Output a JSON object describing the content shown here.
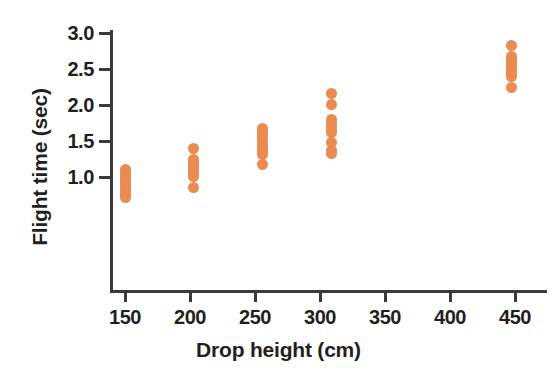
{
  "chart_data": {
    "type": "scatter",
    "title": "",
    "xlabel": "Drop height (cm)",
    "ylabel": "Flight time (sec)",
    "xlim": [
      125,
      475
    ],
    "ylim": [
      0.6,
      3.05
    ],
    "grid": false,
    "legend": null,
    "point_color": "#ea8b52",
    "axis_color": "#3a3a3a",
    "text_color": "#231f20",
    "xticks": [
      150,
      200,
      250,
      300,
      350,
      400,
      450
    ],
    "xtick_labels": [
      "150",
      "200",
      "250",
      "300",
      "350",
      "400",
      "450"
    ],
    "yticks": [
      1.0,
      1.5,
      2.0,
      2.5,
      3.0
    ],
    "ytick_labels": [
      "1.0",
      "1.5",
      "2.0",
      "2.5",
      "3.0"
    ],
    "series": [
      {
        "name": "Flight time measurements",
        "points": [
          {
            "x": 150,
            "y": 1.1
          },
          {
            "x": 150,
            "y": 1.07
          },
          {
            "x": 150,
            "y": 1.04
          },
          {
            "x": 150,
            "y": 1.01
          },
          {
            "x": 150,
            "y": 0.98
          },
          {
            "x": 150,
            "y": 0.95
          },
          {
            "x": 150,
            "y": 0.92
          },
          {
            "x": 150,
            "y": 0.89
          },
          {
            "x": 150,
            "y": 0.86
          },
          {
            "x": 150,
            "y": 0.83
          },
          {
            "x": 150,
            "y": 0.8
          },
          {
            "x": 150,
            "y": 0.77
          },
          {
            "x": 150,
            "y": 0.74
          },
          {
            "x": 150,
            "y": 0.71
          },
          {
            "x": 203,
            "y": 1.39
          },
          {
            "x": 203,
            "y": 1.25
          },
          {
            "x": 203,
            "y": 1.22
          },
          {
            "x": 203,
            "y": 1.19
          },
          {
            "x": 203,
            "y": 1.16
          },
          {
            "x": 203,
            "y": 1.13
          },
          {
            "x": 203,
            "y": 1.1
          },
          {
            "x": 203,
            "y": 1.07
          },
          {
            "x": 203,
            "y": 1.04
          },
          {
            "x": 203,
            "y": 1.01
          },
          {
            "x": 203,
            "y": 0.85
          },
          {
            "x": 256,
            "y": 1.67
          },
          {
            "x": 256,
            "y": 1.63
          },
          {
            "x": 256,
            "y": 1.59
          },
          {
            "x": 256,
            "y": 1.55
          },
          {
            "x": 256,
            "y": 1.51
          },
          {
            "x": 256,
            "y": 1.45
          },
          {
            "x": 256,
            "y": 1.41
          },
          {
            "x": 256,
            "y": 1.37
          },
          {
            "x": 256,
            "y": 1.34
          },
          {
            "x": 256,
            "y": 1.31
          },
          {
            "x": 256,
            "y": 1.18
          },
          {
            "x": 309,
            "y": 2.16
          },
          {
            "x": 309,
            "y": 2.01
          },
          {
            "x": 309,
            "y": 1.8
          },
          {
            "x": 309,
            "y": 1.76
          },
          {
            "x": 309,
            "y": 1.7
          },
          {
            "x": 309,
            "y": 1.66
          },
          {
            "x": 309,
            "y": 1.62
          },
          {
            "x": 309,
            "y": 1.48
          },
          {
            "x": 309,
            "y": 1.37
          },
          {
            "x": 309,
            "y": 1.33
          },
          {
            "x": 447,
            "y": 2.83
          },
          {
            "x": 447,
            "y": 2.68
          },
          {
            "x": 447,
            "y": 2.64
          },
          {
            "x": 447,
            "y": 2.6
          },
          {
            "x": 447,
            "y": 2.56
          },
          {
            "x": 447,
            "y": 2.52
          },
          {
            "x": 447,
            "y": 2.48
          },
          {
            "x": 447,
            "y": 2.44
          },
          {
            "x": 447,
            "y": 2.4
          },
          {
            "x": 447,
            "y": 2.25
          }
        ]
      }
    ]
  }
}
